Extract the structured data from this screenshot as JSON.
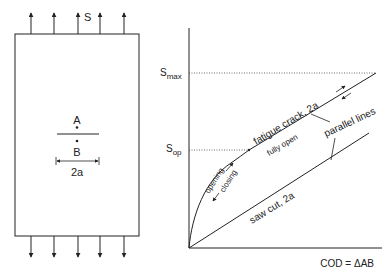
{
  "specimen": {
    "load_label": "S",
    "point_a_label": "A",
    "point_b_label": "B",
    "crack_length_label": "2a",
    "top_arrow_count": 5,
    "bottom_arrow_count": 5
  },
  "graph": {
    "y_tick_max": "S",
    "y_tick_max_sub": "max",
    "y_tick_op": "S",
    "y_tick_op_sub": "op",
    "x_axis_label": "COD = ΔAB",
    "curve_fatigue_label": "fatigue crack, 2a",
    "curve_fatigue_sublabel": "fully open",
    "curve_sawcut_label": "saw cut, 2a",
    "annotation_parallel": "parallel lines",
    "annotation_opening": "opening",
    "annotation_closing": "closing"
  },
  "colors": {
    "line": "#222222",
    "background": "#ffffff"
  }
}
